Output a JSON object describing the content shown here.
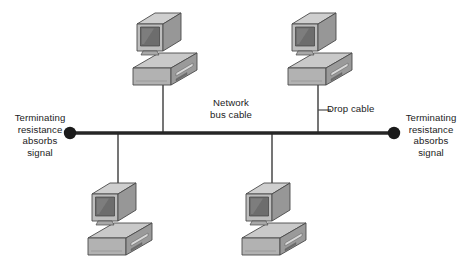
{
  "diagram": {
    "background_color": "#ffffff",
    "line_color": "#3a3a3a",
    "device_fill": "#b6b6b6",
    "device_shadow": "#8d8d8d",
    "device_highlight": "#d8d8d8",
    "screen_color": "#6f6f6f"
  },
  "labels": {
    "left_terminator": {
      "line1": "Terminating",
      "line2": "resistance",
      "line3": "absorbs",
      "line4": "signal"
    },
    "right_terminator": {
      "line1": "Terminating",
      "line2": "resistance",
      "line3": "absorbs",
      "line4": "signal"
    },
    "bus_cable": {
      "line1": "Network",
      "line2": "bus cable"
    },
    "drop_cable": {
      "line1": "Drop cable"
    }
  },
  "nodes": [
    {
      "name": "workstation-top-left",
      "x": 163,
      "y": 48,
      "position": "above-bus"
    },
    {
      "name": "workstation-top-right",
      "x": 318,
      "y": 48,
      "position": "above-bus"
    },
    {
      "name": "workstation-bottom-left",
      "x": 118,
      "y": 222,
      "position": "below-bus"
    },
    {
      "name": "workstation-bottom-right",
      "x": 272,
      "y": 222,
      "position": "below-bus"
    }
  ],
  "bus": {
    "y": 133,
    "x_start": 70,
    "x_end": 394,
    "terminator_left_x": 70,
    "terminator_right_x": 394,
    "terminator_radius": 6
  },
  "drop_cables": [
    {
      "name": "drop-cable-top-left",
      "x": 163,
      "from_y": 133,
      "to_y": 78
    },
    {
      "name": "drop-cable-top-right",
      "x": 318,
      "from_y": 133,
      "to_y": 78
    },
    {
      "name": "drop-cable-bottom-left",
      "x": 118,
      "from_y": 133,
      "to_y": 196
    },
    {
      "name": "drop-cable-bottom-right",
      "x": 272,
      "from_y": 133,
      "to_y": 196
    }
  ],
  "leader": {
    "name": "drop-cable-leader",
    "x_start": 318,
    "x_end": 330,
    "y": 110
  }
}
